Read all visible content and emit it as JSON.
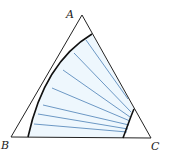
{
  "figure": {
    "type": "ternary-phase-diagram",
    "vertices": [
      {
        "id": "A",
        "label": "A"
      },
      {
        "id": "B",
        "label": "B"
      },
      {
        "id": "C",
        "label": "C"
      }
    ],
    "colors": {
      "triangle": "#222222",
      "binodal_curve": "#111111",
      "tie_lines": "#4a7fb5",
      "region_fill": "#eef7fd"
    },
    "tie_line_count": 9
  }
}
